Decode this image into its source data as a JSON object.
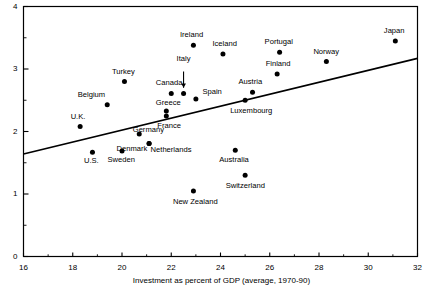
{
  "figure": {
    "x_axis_title": "Investment as percent of GDP (average, 1970-90)",
    "source_note": ""
  },
  "chart_data": {
    "type": "scatter",
    "title": "",
    "subtitle": "",
    "xlabel": "Investment as percent of GDP (average, 1970-90)",
    "ylabel": "",
    "xlim": [
      16,
      32
    ],
    "ylim": [
      0,
      4
    ],
    "grid": false,
    "legend": null,
    "xticks": [
      16,
      18,
      20,
      22,
      24,
      26,
      28,
      30,
      32
    ],
    "xtick_labels": [
      "16",
      "18",
      "20",
      "22",
      "24",
      "26",
      "28",
      "30",
      "32"
    ],
    "x_minor_ticks": [
      17,
      19,
      21,
      23,
      25,
      27,
      29,
      31
    ],
    "yticks": [
      0,
      1,
      2,
      3,
      4
    ],
    "ytick_labels": [
      "0",
      "1",
      "2",
      "3",
      "4"
    ],
    "y_minor_ticks": [
      0.5,
      1.5,
      2.5,
      3.5
    ],
    "points": [
      {
        "name": "U.K.",
        "x": 18.3,
        "y": 2.08,
        "label_dx": -2,
        "label_dy": -10,
        "label_align": "center"
      },
      {
        "name": "Belgium",
        "x": 19.4,
        "y": 2.43,
        "label_dx": -16,
        "label_dy": -10,
        "label_align": "center"
      },
      {
        "name": "Turkey",
        "x": 20.1,
        "y": 2.8,
        "label_dx": -1,
        "label_dy": -10,
        "label_align": "center"
      },
      {
        "name": "Germany",
        "x": 20.7,
        "y": 1.96,
        "label_dx": 9,
        "label_dy": -4,
        "label_align": "center"
      },
      {
        "name": "U.S.",
        "x": 18.8,
        "y": 1.67,
        "label_dx": -1,
        "label_dy": 9,
        "label_align": "center"
      },
      {
        "name": "Denmark",
        "x": 21.1,
        "y": 1.81,
        "label_dx": -17,
        "label_dy": 6,
        "label_align": "center"
      },
      {
        "name": "Sweden",
        "x": 20.0,
        "y": 1.69,
        "label_dx": -1,
        "label_dy": 9,
        "label_align": "center"
      },
      {
        "name": "Netherlands",
        "x": 21.1,
        "y": 1.81,
        "label_dx": 22,
        "label_dy": 7,
        "label_align": "center"
      },
      {
        "name": "Canada",
        "x": 22.0,
        "y": 2.61,
        "label_dx": -2,
        "label_dy": -10,
        "label_align": "center"
      },
      {
        "name": "Greece",
        "x": 21.8,
        "y": 2.33,
        "label_dx": 2,
        "label_dy": -8,
        "label_align": "center"
      },
      {
        "name": "France",
        "x": 21.8,
        "y": 2.25,
        "label_dx": 3,
        "label_dy": 10,
        "label_align": "center"
      },
      {
        "name": "Italy",
        "x": 22.5,
        "y": 2.61,
        "label_dx": 0,
        "label_dy": -34,
        "label_align": "center"
      },
      {
        "name": "Ireland",
        "x": 22.9,
        "y": 3.38,
        "label_dx": -2,
        "label_dy": -10,
        "label_align": "center"
      },
      {
        "name": "Spain",
        "x": 23.0,
        "y": 2.52,
        "label_dx": 16,
        "label_dy": -7,
        "label_align": "center"
      },
      {
        "name": "New Zealand",
        "x": 22.9,
        "y": 1.05,
        "label_dx": 2,
        "label_dy": 11,
        "label_align": "center"
      },
      {
        "name": "Iceland",
        "x": 24.1,
        "y": 3.24,
        "label_dx": 2,
        "label_dy": -10,
        "label_align": "center"
      },
      {
        "name": "Australia",
        "x": 24.6,
        "y": 1.7,
        "label_dx": -1,
        "label_dy": 10,
        "label_align": "center"
      },
      {
        "name": "Luxembourg",
        "x": 25.0,
        "y": 2.5,
        "label_dx": 6,
        "label_dy": 11,
        "label_align": "center"
      },
      {
        "name": "Austria",
        "x": 25.3,
        "y": 2.63,
        "label_dx": -2,
        "label_dy": -10,
        "label_align": "center"
      },
      {
        "name": "Switzerland",
        "x": 25.0,
        "y": 1.3,
        "label_dx": 0,
        "label_dy": 11,
        "label_align": "center"
      },
      {
        "name": "Finland",
        "x": 26.3,
        "y": 2.92,
        "label_dx": 1,
        "label_dy": -10,
        "label_align": "center"
      },
      {
        "name": "Portugal",
        "x": 26.4,
        "y": 3.27,
        "label_dx": -1,
        "label_dy": -10,
        "label_align": "center"
      },
      {
        "name": "Norway",
        "x": 28.3,
        "y": 3.12,
        "label_dx": 0,
        "label_dy": -10,
        "label_align": "center"
      },
      {
        "name": "Japan",
        "x": 31.1,
        "y": 3.45,
        "label_dx": -1,
        "label_dy": -10,
        "label_align": "center"
      }
    ],
    "trendline": {
      "x_start": 16.0,
      "y_start": 1.64,
      "x_end": 32.0,
      "y_end": 3.17
    },
    "annotations": [
      {
        "type": "arrow",
        "for": "Italy",
        "from_x": 22.5,
        "from_y": 2.96,
        "to_x": 22.5,
        "to_y": 2.7
      }
    ]
  }
}
